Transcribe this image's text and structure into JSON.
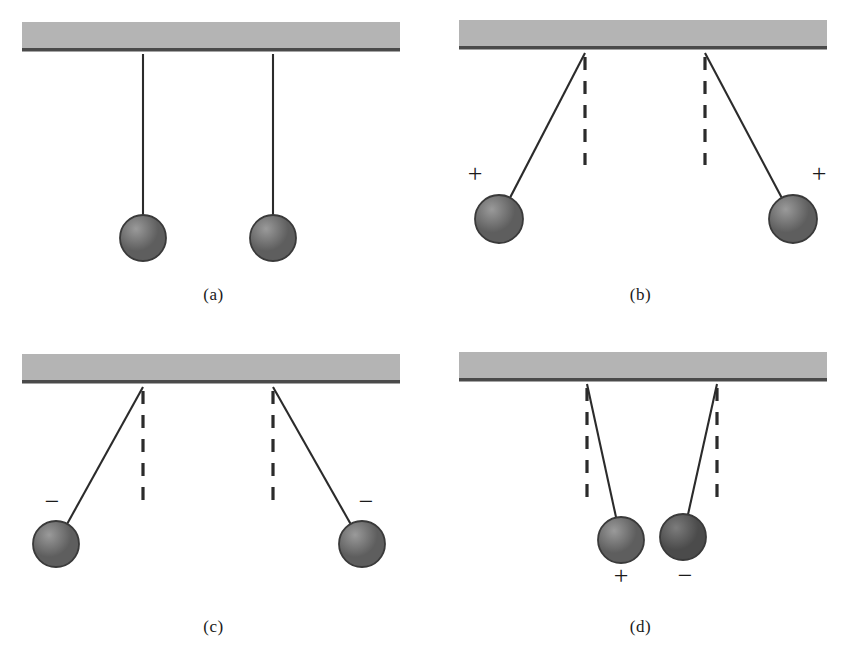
{
  "figure": {
    "panel_count": 4,
    "ceiling_color": "#b4b4b4",
    "ceiling_edge_color": "#4a4a4a",
    "string_color": "#2b2b2b",
    "dashed_color": "#2b2b2b",
    "ball_light_color": "#9a9a9a",
    "ball_dark_color": "#5e5e5e",
    "ball_outline_color": "#3a3a3a",
    "label_color": "#1a1a1a"
  },
  "panels": [
    {
      "id": "a",
      "label": "(a)",
      "description": "Two uncharged balls hang vertically at rest",
      "ceiling": {
        "x1": 22,
        "x2": 400,
        "y": 22,
        "height": 26
      },
      "pendulums": [
        {
          "name": "left",
          "pivot_x": 143,
          "pivot_y": 54,
          "ball_x": 143,
          "ball_y": 238,
          "radius": 23,
          "charge": "",
          "shade": "light",
          "dashed": false
        },
        {
          "name": "right",
          "pivot_x": 273,
          "pivot_y": 54,
          "ball_x": 273,
          "ball_y": 238,
          "radius": 23,
          "charge": "",
          "shade": "light",
          "dashed": false
        }
      ]
    },
    {
      "id": "b",
      "label": "(b)",
      "description": "Two like positive charges repel and swing apart",
      "ceiling": {
        "x1": 32,
        "x2": 400,
        "y": 20,
        "height": 26
      },
      "pendulums": [
        {
          "name": "left",
          "pivot_x": 158,
          "pivot_y": 53,
          "ball_x": 72,
          "ball_y": 219,
          "radius": 24,
          "charge": "+",
          "charge_x": 48,
          "charge_y": 182,
          "shade": "light",
          "dashed": true,
          "dash_bottom": 165
        },
        {
          "name": "right",
          "pivot_x": 278,
          "pivot_y": 53,
          "ball_x": 366,
          "ball_y": 219,
          "radius": 24,
          "charge": "+",
          "charge_x": 392,
          "charge_y": 182,
          "shade": "light",
          "dashed": true,
          "dash_bottom": 165
        }
      ]
    },
    {
      "id": "c",
      "label": "(c)",
      "description": "Two like negative charges repel and swing apart",
      "ceiling": {
        "x1": 22,
        "x2": 400,
        "y": 22,
        "height": 26
      },
      "pendulums": [
        {
          "name": "left",
          "pivot_x": 143,
          "pivot_y": 55,
          "ball_x": 56,
          "ball_y": 212,
          "radius": 23,
          "charge": "−",
          "charge_x": 52,
          "charge_y": 178,
          "shade": "light",
          "dashed": true,
          "dash_bottom": 170
        },
        {
          "name": "right",
          "pivot_x": 273,
          "pivot_y": 55,
          "ball_x": 362,
          "ball_y": 212,
          "radius": 23,
          "charge": "−",
          "charge_x": 366,
          "charge_y": 178,
          "shade": "light",
          "dashed": true,
          "dash_bottom": 170
        }
      ]
    },
    {
      "id": "d",
      "label": "(d)",
      "description": "Opposite charges attract and swing toward each other",
      "ceiling": {
        "x1": 32,
        "x2": 400,
        "y": 20,
        "height": 26
      },
      "pendulums": [
        {
          "name": "left",
          "pivot_x": 160,
          "pivot_y": 52,
          "ball_x": 194,
          "ball_y": 208,
          "radius": 23,
          "charge": "+",
          "charge_x": 194,
          "charge_y": 252,
          "shade": "light",
          "dashed": true,
          "dash_bottom": 170
        },
        {
          "name": "right",
          "pivot_x": 290,
          "pivot_y": 52,
          "ball_x": 256,
          "ball_y": 205,
          "radius": 23,
          "charge": "−",
          "charge_x": 258,
          "charge_y": 252,
          "shade": "dark",
          "dashed": true,
          "dash_bottom": 170
        }
      ]
    }
  ]
}
